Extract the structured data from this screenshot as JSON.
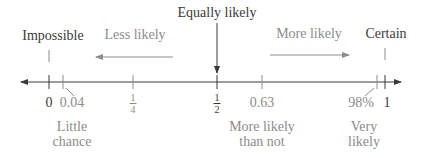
{
  "diagram": {
    "type": "probability-scale",
    "colors": {
      "dark": "#3a3a3a",
      "grey": "#8c8c8c",
      "line": "#3a3a3a",
      "background": "#ffffff"
    },
    "top_labels": {
      "equally_likely": "Equally likely",
      "impossible": "Impossible",
      "less_likely": "Less likely",
      "more_likely": "More likely",
      "certain": "Certain"
    },
    "ticks": [
      {
        "id": "zero",
        "label": "0",
        "value": 0
      },
      {
        "id": "point04",
        "label": "0.04",
        "value": 0.04
      },
      {
        "id": "quarter",
        "numerator": "1",
        "denominator": "4",
        "value": 0.25
      },
      {
        "id": "half",
        "numerator": "1",
        "denominator": "2",
        "value": 0.5
      },
      {
        "id": "point63",
        "label": "0.63",
        "value": 0.63
      },
      {
        "id": "ninety8",
        "label": "98%",
        "value": 0.98
      },
      {
        "id": "one",
        "label": "1",
        "value": 1
      }
    ],
    "bottom_labels": {
      "little_chance": [
        "Little",
        "chance"
      ],
      "more_likely_than_not": [
        "More likely",
        "than not"
      ],
      "very_likely": [
        "Very",
        "likely"
      ]
    }
  }
}
